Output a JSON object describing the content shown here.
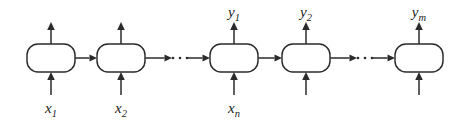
{
  "figure": {
    "type": "rnn-encoder-decoder-unrolled-diagram",
    "background_color": "#ffffff",
    "stroke_color": "#2b2b2b",
    "label_color": "#1c1c1c",
    "width": 463,
    "height": 121
  },
  "cells": [
    {
      "id": "cell-1",
      "index": 1,
      "x": 27,
      "y": 44,
      "w": 48,
      "h": 28,
      "r": 11,
      "input_label": "x",
      "input_sub": "1",
      "output_label": "",
      "output_sub": ""
    },
    {
      "id": "cell-2",
      "index": 2,
      "x": 97,
      "y": 44,
      "w": 48,
      "h": 28,
      "r": 11,
      "input_label": "x",
      "input_sub": "2",
      "output_label": "",
      "output_sub": ""
    },
    {
      "id": "cell-3",
      "index": 3,
      "x": 210,
      "y": 44,
      "w": 48,
      "h": 28,
      "r": 11,
      "input_label": "x",
      "input_sub": "n",
      "output_label": "y",
      "output_sub": "1"
    },
    {
      "id": "cell-4",
      "index": 4,
      "x": 282,
      "y": 44,
      "w": 48,
      "h": 28,
      "r": 11,
      "input_label": "",
      "input_sub": "",
      "output_label": "y",
      "output_sub": "2"
    },
    {
      "id": "cell-5",
      "index": 5,
      "x": 395,
      "y": 44,
      "w": 48,
      "h": 28,
      "r": 11,
      "input_label": "",
      "input_sub": "",
      "output_label": "y",
      "output_sub": "m"
    }
  ],
  "input_labels": [
    {
      "name": "x-1",
      "base": "x",
      "sub": "1",
      "x": 51,
      "y": 113
    },
    {
      "name": "x-2",
      "base": "x",
      "sub": "2",
      "x": 121,
      "y": 113
    },
    {
      "name": "x-n",
      "base": "x",
      "sub": "n",
      "x": 234,
      "y": 113
    }
  ],
  "output_labels": [
    {
      "name": "y-1",
      "base": "y",
      "sub": "1",
      "x": 234,
      "y": 17
    },
    {
      "name": "y-2",
      "base": "y",
      "sub": "2",
      "x": 306,
      "y": 17
    },
    {
      "name": "y-m",
      "base": "y",
      "sub": "m",
      "x": 419,
      "y": 17
    }
  ],
  "horizontal_connections": [
    {
      "name": "conn-1-to-2",
      "from_x": 75,
      "to_x": 97,
      "y": 58
    },
    {
      "name": "conn-2-to-ellipsis-1",
      "from_x": 145,
      "to_x": 172,
      "y": 58
    },
    {
      "name": "conn-ellipsis-1-to-3",
      "from_x": 188,
      "to_x": 210,
      "y": 58
    },
    {
      "name": "conn-3-to-4",
      "from_x": 258,
      "to_x": 282,
      "y": 58
    },
    {
      "name": "conn-4-to-ellipsis-2",
      "from_x": 330,
      "to_x": 357,
      "y": 58
    },
    {
      "name": "conn-ellipsis-2-to-5",
      "from_x": 373,
      "to_x": 395,
      "y": 58
    }
  ],
  "vertical_inputs": [
    {
      "name": "input-arrow-1",
      "x": 51,
      "from_y": 95,
      "to_y": 72
    },
    {
      "name": "input-arrow-2",
      "x": 121,
      "from_y": 95,
      "to_y": 72
    },
    {
      "name": "input-arrow-3",
      "x": 234,
      "from_y": 95,
      "to_y": 72
    },
    {
      "name": "input-arrow-4",
      "x": 306,
      "from_y": 95,
      "to_y": 72
    },
    {
      "name": "input-arrow-5",
      "x": 419,
      "from_y": 95,
      "to_y": 72
    }
  ],
  "vertical_outputs": [
    {
      "name": "output-arrow-1",
      "x": 51,
      "from_y": 44,
      "to_y": 22
    },
    {
      "name": "output-arrow-2",
      "x": 121,
      "from_y": 44,
      "to_y": 22
    },
    {
      "name": "output-arrow-3",
      "x": 234,
      "from_y": 44,
      "to_y": 22
    },
    {
      "name": "output-arrow-4",
      "x": 306,
      "from_y": 44,
      "to_y": 22
    },
    {
      "name": "output-arrow-5",
      "x": 419,
      "from_y": 44,
      "to_y": 22
    }
  ],
  "ellipses": [
    {
      "name": "ellipsis-1",
      "dots": 3,
      "cx": 180,
      "cy": 58,
      "spacing": 7,
      "radius": 1.3
    },
    {
      "name": "ellipsis-2",
      "dots": 3,
      "cx": 365,
      "cy": 58,
      "spacing": 7,
      "radius": 1.3
    }
  ]
}
